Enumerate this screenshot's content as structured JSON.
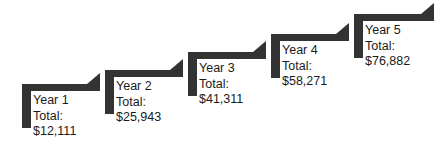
{
  "chart_data": {
    "type": "bar",
    "title": "",
    "subtitle": "",
    "xlabel": "",
    "ylabel": "",
    "categories": [
      "Year 1",
      "Year 2",
      "Year 3",
      "Year 4",
      "Year 5"
    ],
    "values": [
      12111,
      25943,
      41311,
      58271,
      76882
    ],
    "value_labels": [
      "$12,111",
      "$25,943",
      "$41,311",
      "$58,271",
      "$76,882"
    ],
    "legend": [],
    "grid": false,
    "annotations": [
      "Year 1 Total: $12,111",
      "Year 2 Total: $25,943",
      "Year 3 Total: $41,311",
      "Year 4 Total: $58,271",
      "Year 5 Total: $76,882"
    ],
    "style_note": "ascending-staircase-steps-with-arrowheads"
  },
  "diagram": {
    "accent_color": "#333333",
    "text_color": "#1a1a1a",
    "background_color": "#ffffff",
    "total_line_label": "Total:",
    "steps": [
      {
        "name": "Year 1",
        "total_label": "Total:",
        "amount": "$12,111",
        "x": 22,
        "y": 84,
        "tread_width": 78,
        "riser_height": 44,
        "label_x": 33,
        "label_y": 93
      },
      {
        "name": "Year 2",
        "total_label": "Total:",
        "amount": "$25,943",
        "x": 105,
        "y": 70,
        "tread_width": 78,
        "riser_height": 44,
        "label_x": 116,
        "label_y": 79
      },
      {
        "name": "Year 3",
        "total_label": "Total:",
        "amount": "$41,311",
        "x": 188,
        "y": 52,
        "tread_width": 78,
        "riser_height": 44,
        "label_x": 199,
        "label_y": 61
      },
      {
        "name": "Year 4",
        "total_label": "Total:",
        "amount": "$58,271",
        "x": 271,
        "y": 34,
        "tread_width": 78,
        "riser_height": 44,
        "label_x": 282,
        "label_y": 43
      },
      {
        "name": "Year 5",
        "total_label": "Total:",
        "amount": "$76,882",
        "x": 354,
        "y": 14,
        "tread_width": 80,
        "riser_height": 44,
        "label_x": 365,
        "label_y": 23
      }
    ]
  }
}
